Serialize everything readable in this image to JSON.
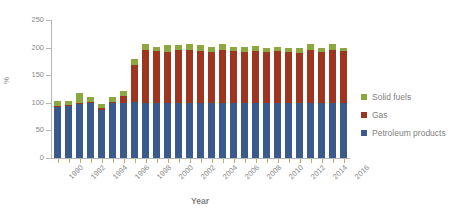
{
  "chart_data": {
    "type": "bar",
    "stacked": true,
    "title": "",
    "xlabel": "Year",
    "ylabel": "%",
    "ylim": [
      0,
      250
    ],
    "ytick_step": 50,
    "yticks": [
      0,
      50,
      100,
      150,
      200,
      250
    ],
    "grid": false,
    "legend_position": "right",
    "x": [
      1990,
      1991,
      1992,
      1993,
      1994,
      1995,
      1996,
      1997,
      1998,
      1999,
      2000,
      2001,
      2002,
      2003,
      2004,
      2005,
      2006,
      2007,
      2008,
      2009,
      2010,
      2011,
      2012,
      2013,
      2014,
      2015,
      2016
    ],
    "xtick_labels": [
      "1990",
      "1992",
      "1994",
      "1996",
      "1998",
      "2000",
      "2002",
      "2004",
      "2006",
      "2008",
      "2010",
      "2012",
      "2014",
      "2016"
    ],
    "categories": [
      "1990",
      "1991",
      "1992",
      "1993",
      "1994",
      "1995",
      "1996",
      "1997",
      "1998",
      "1999",
      "2000",
      "2001",
      "2002",
      "2003",
      "2004",
      "2005",
      "2006",
      "2007",
      "2008",
      "2009",
      "2010",
      "2011",
      "2012",
      "2013",
      "2014",
      "2015",
      "2016"
    ],
    "series": [
      {
        "name": "Petroleum products",
        "color": "#3A5A8C",
        "values": [
          93,
          94,
          97,
          99,
          87,
          99,
          100,
          101,
          100,
          100,
          100,
          100,
          100,
          100,
          100,
          100,
          100,
          100,
          100,
          100,
          100,
          100,
          100,
          100,
          100,
          100,
          100
        ]
      },
      {
        "name": "Gas",
        "color": "#9E3520",
        "values": [
          2,
          2,
          3,
          3,
          3,
          3,
          12,
          68,
          95,
          94,
          92,
          95,
          95,
          93,
          92,
          95,
          94,
          92,
          94,
          92,
          93,
          92,
          91,
          96,
          92,
          96,
          94
        ]
      },
      {
        "name": "Solid fuels",
        "color": "#8CA73F",
        "values": [
          9,
          8,
          17,
          8,
          8,
          8,
          9,
          11,
          12,
          8,
          12,
          10,
          12,
          11,
          10,
          11,
          8,
          10,
          9,
          8,
          9,
          8,
          9,
          11,
          8,
          11,
          6
        ]
      }
    ],
    "totals": [
      104,
      104,
      117,
      110,
      98,
      110,
      121,
      180,
      207,
      202,
      204,
      205,
      207,
      204,
      202,
      206,
      202,
      202,
      203,
      200,
      202,
      200,
      200,
      207,
      200,
      207,
      200
    ]
  },
  "legend": {
    "items": [
      {
        "label": "Solid fuels",
        "color": "#8CA73F"
      },
      {
        "label": "Gas",
        "color": "#9E3520"
      },
      {
        "label": "Petroleum products",
        "color": "#3A5A8C"
      }
    ]
  },
  "axes": {
    "x_title": "Year",
    "y_title": "%"
  }
}
